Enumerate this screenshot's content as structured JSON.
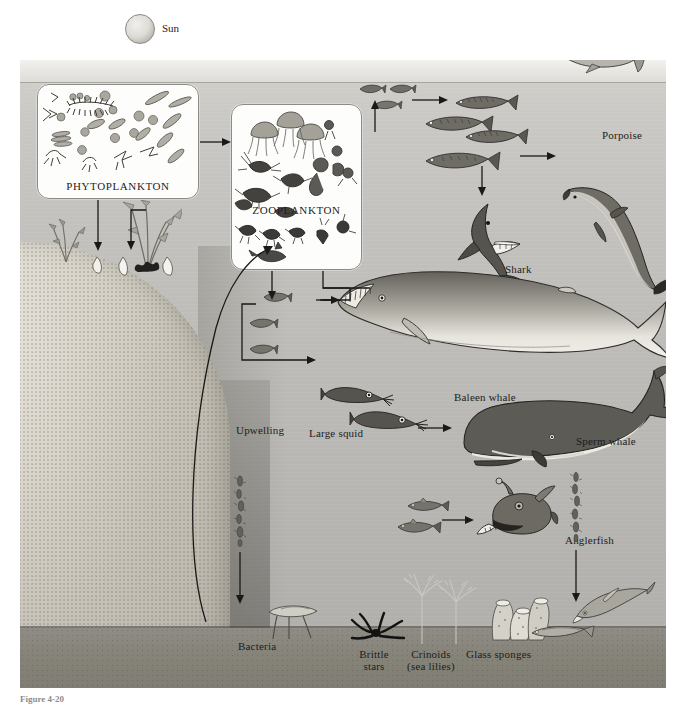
{
  "figure": {
    "caption": "Figure 4-20",
    "title_alt": "Marine food web diagram"
  },
  "sun": {
    "label": "Sun",
    "icon": "sun-icon"
  },
  "boxes": [
    {
      "id": "phytoplankton",
      "label": "PHYTOPLANKTON"
    },
    {
      "id": "zooplankton",
      "label": "ZOOPLANKTON"
    }
  ],
  "labels": [
    {
      "id": "porpoise",
      "text": "Porpoise"
    },
    {
      "id": "shark",
      "text": "Shark"
    },
    {
      "id": "baleen-whale",
      "text": "Baleen whale"
    },
    {
      "id": "sperm-whale",
      "text": "Sperm whale"
    },
    {
      "id": "large-squid",
      "text": "Large squid"
    },
    {
      "id": "anglerfish",
      "text": "Anglerfish"
    },
    {
      "id": "upwelling",
      "text": "Upwelling"
    },
    {
      "id": "bacteria",
      "text": "Bacteria"
    },
    {
      "id": "brittle-stars",
      "text": "Brittle\nstars"
    },
    {
      "id": "crinoids",
      "text": "Crinoids\n(sea lilies)"
    },
    {
      "id": "glass-sponges",
      "text": "Glass sponges"
    }
  ],
  "label_text": {
    "porpoise": "Porpoise",
    "shark": "Shark",
    "baleen_whale": "Baleen whale",
    "sperm_whale": "Sperm whale",
    "large_squid": "Large squid",
    "anglerfish": "Anglerfish",
    "upwelling": "Upwelling",
    "bacteria": "Bacteria",
    "brittle_stars_l1": "Brittle",
    "brittle_stars_l2": "stars",
    "crinoids_l1": "Crinoids",
    "crinoids_l2": "(sea lilies)",
    "glass_sponges": "Glass sponges"
  },
  "organisms": [
    "flying-fish-icon",
    "seabird-icon",
    "small-fish-icon",
    "surface-fish-icon",
    "school-fish-icon",
    "mackerel-icon",
    "shark-icon",
    "porpoise-icon",
    "baleen-whale-icon",
    "sperm-whale-icon",
    "squid-icon",
    "anglerfish-icon",
    "deep-fish-icon",
    "marine-snow-icon",
    "bacteria-icon",
    "brittle-star-icon",
    "crinoid-icon",
    "glass-sponge-icon",
    "kelp-icon",
    "shellfish-icon"
  ],
  "colors": {
    "water_top": "#d6d4cf",
    "water_deep": "#aeadaa",
    "seafloor": "#868479",
    "ink": "#191918",
    "box_fill": "#fdfdfc",
    "box_stroke": "#8d8b85"
  }
}
